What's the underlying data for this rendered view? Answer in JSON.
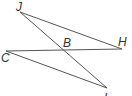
{
  "diagram": {
    "type": "geometry",
    "points": {
      "J": {
        "label": "J",
        "x": 20,
        "y": 12
      },
      "H": {
        "label": "H",
        "x": 122,
        "y": 49
      },
      "C": {
        "label": "C",
        "x": 6,
        "y": 51
      },
      "L": {
        "label": "L",
        "x": 107,
        "y": 88
      },
      "B": {
        "label": "B",
        "x": 64,
        "y": 50
      }
    },
    "segments": [
      [
        "J",
        "H"
      ],
      [
        "J",
        "L"
      ],
      [
        "C",
        "H"
      ],
      [
        "C",
        "L"
      ]
    ],
    "line_color": "#555555"
  }
}
